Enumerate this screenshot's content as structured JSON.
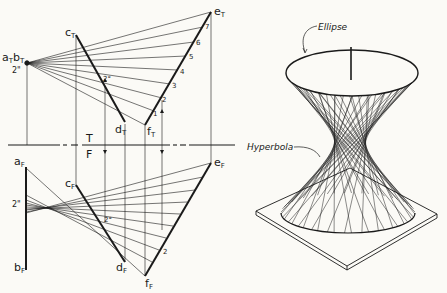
{
  "figure": {
    "left_panel": {
      "title": "Orthographic construction (top & front views)",
      "folding_line": {
        "top_label": "T",
        "bottom_label": "F"
      },
      "top_view_labels": {
        "ab": {
          "a": "a",
          "b": "b",
          "sub": "T"
        },
        "c": {
          "main": "c",
          "sub": "T"
        },
        "d": {
          "main": "d",
          "sub": "T"
        },
        "e": {
          "main": "e",
          "sub": "T"
        },
        "f": {
          "main": "f",
          "sub": "T"
        },
        "spacing": "2\"",
        "angle": "2°",
        "divisions": [
          "1",
          "2",
          "3",
          "4",
          "5",
          "6",
          "7"
        ]
      },
      "front_view_labels": {
        "a": {
          "main": "a",
          "sub": "F"
        },
        "b": {
          "main": "b",
          "sub": "F"
        },
        "c": {
          "main": "c",
          "sub": "F"
        },
        "d": {
          "main": "d",
          "sub": "F"
        },
        "e": {
          "main": "e",
          "sub": "F"
        },
        "f": {
          "main": "f",
          "sub": "F"
        },
        "spacing": "2\"",
        "angle": "2°",
        "divisions": [
          "2"
        ]
      }
    },
    "right_panel": {
      "title": "Hyperboloid of one sheet on base plate",
      "callouts": {
        "ellipse": "Ellipse",
        "hyperbola": "Hyperbola"
      }
    },
    "colors": {
      "ink": "#1a1a1a",
      "paper": "#fbfaf6"
    }
  }
}
